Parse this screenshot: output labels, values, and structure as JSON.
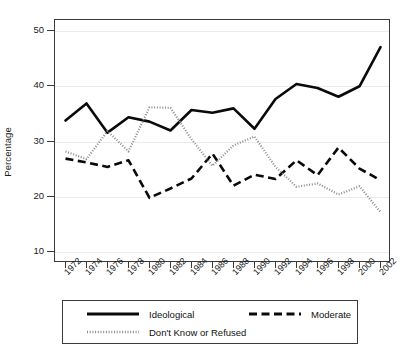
{
  "chart_data": {
    "type": "line",
    "title": "",
    "xlabel": "",
    "ylabel": "Percentage",
    "grid": true,
    "legend_position": "bottom",
    "x": [
      1972,
      1974,
      1976,
      1978,
      1980,
      1982,
      1984,
      1986,
      1988,
      1990,
      1992,
      1994,
      1996,
      1998,
      2000,
      2002
    ],
    "xtick_labels": [
      "1972",
      "1974",
      "1976",
      "1978",
      "1980",
      "1982",
      "1984",
      "1986",
      "1988",
      "1990",
      "1992",
      "1994",
      "1996",
      "1998",
      "2000",
      "2002"
    ],
    "ytick_labels": [
      "10",
      "20",
      "30",
      "40",
      "50"
    ],
    "yticks": [
      10,
      20,
      30,
      40,
      50
    ],
    "ylim": [
      8.0,
      52.0
    ],
    "xlim": [
      1971.0,
      2003.0
    ],
    "series": [
      {
        "name": "Ideological",
        "style": "solid",
        "color": "#0a0a0a",
        "values": [
          33.8,
          36.9,
          31.6,
          34.4,
          33.6,
          32.0,
          35.7,
          35.2,
          36.0,
          32.3,
          37.7,
          40.4,
          39.7,
          38.1,
          40.0,
          47.1
        ]
      },
      {
        "name": "Moderate",
        "style": "dashed",
        "color": "#0a0a0a",
        "values": [
          26.9,
          26.2,
          25.4,
          26.6,
          19.8,
          21.5,
          23.3,
          27.8,
          22.0,
          24.0,
          23.2,
          26.6,
          23.9,
          28.9,
          25.1,
          23.0
        ]
      },
      {
        "name": "Don't Know or Refused",
        "style": "dotted",
        "color": "#8d8d8d",
        "values": [
          28.2,
          26.8,
          31.9,
          28.2,
          36.2,
          36.1,
          30.4,
          25.6,
          29.3,
          30.9,
          25.4,
          21.8,
          22.4,
          20.4,
          21.9,
          17.2
        ]
      }
    ]
  },
  "legend": {
    "items": [
      {
        "label": "Ideological",
        "key": "solid-line-key"
      },
      {
        "label": "Moderate",
        "key": "dashed-line-key"
      },
      {
        "label": "Don't Know or Refused",
        "key": "dotted-line-key"
      }
    ]
  }
}
